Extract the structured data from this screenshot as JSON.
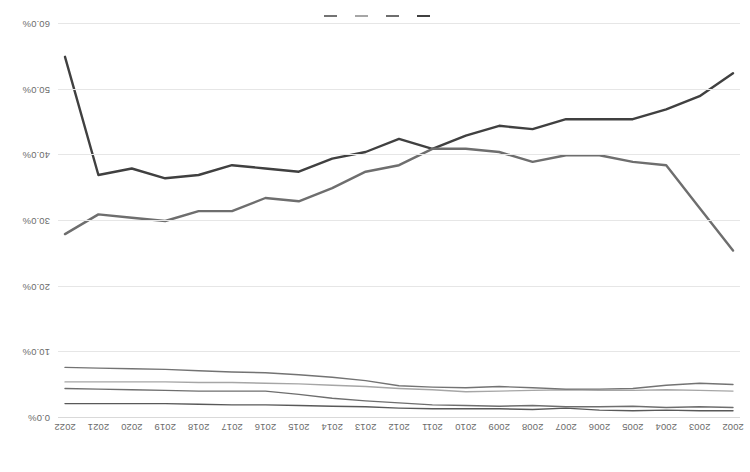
{
  "chart_data": {
    "type": "line",
    "title": "",
    "subtitle": "",
    "xlabel": "",
    "ylabel": "",
    "grid": true,
    "legend_position": "bottom",
    "orientation_note": "rotated-180",
    "xlim": [
      2002,
      2022
    ],
    "ylim": [
      0.0,
      60.0
    ],
    "ytick_labels": [
      "0.0%",
      "10.0%",
      "20.0%",
      "30.0%",
      "40.0%",
      "50.0%",
      "60.0%"
    ],
    "ytick_values": [
      0,
      10,
      20,
      30,
      40,
      50,
      60
    ],
    "categories": [
      "2002",
      "2003",
      "2004",
      "2005",
      "2006",
      "2007",
      "2008",
      "2009",
      "2010",
      "2011",
      "2012",
      "2013",
      "2014",
      "2015",
      "2016",
      "2017",
      "2018",
      "2019",
      "2020",
      "2021",
      "2022"
    ],
    "x": [
      2002,
      2003,
      2004,
      2005,
      2006,
      2007,
      2008,
      2009,
      2010,
      2011,
      2012,
      2013,
      2014,
      2015,
      2016,
      2017,
      2018,
      2019,
      2020,
      2021,
      2022
    ],
    "series": [
      {
        "name": "Series 1",
        "color": "#404040",
        "width": 2.4,
        "values": [
          52.5,
          49.0,
          47.0,
          45.5,
          45.5,
          45.5,
          44.0,
          44.5,
          43.0,
          41.0,
          42.5,
          40.5,
          39.5,
          37.5,
          38.0,
          38.5,
          37.0,
          36.5,
          38.0,
          37.0,
          55.0
        ]
      },
      {
        "name": "Series 2",
        "color": "#6e6e6e",
        "width": 2.4,
        "values": [
          25.5,
          32.0,
          38.5,
          39.0,
          40.0,
          40.0,
          39.0,
          40.5,
          41.0,
          41.0,
          38.5,
          37.5,
          35.0,
          33.0,
          33.5,
          31.5,
          31.5,
          30.0,
          30.5,
          31.0,
          28.0
        ]
      },
      {
        "name": "Series 3",
        "color": "#595959",
        "width": 1.4,
        "values": [
          1.1,
          1.1,
          1.2,
          1.1,
          1.2,
          1.5,
          1.3,
          1.4,
          1.4,
          1.4,
          1.5,
          1.7,
          1.8,
          1.9,
          2.0,
          2.0,
          2.1,
          2.2,
          2.2,
          2.2,
          2.2
        ]
      },
      {
        "name": "Series 4",
        "color": "#6e6e6e",
        "width": 1.4,
        "values": [
          1.6,
          1.7,
          1.6,
          1.8,
          1.7,
          1.7,
          1.9,
          1.8,
          1.9,
          2.0,
          2.3,
          2.6,
          3.0,
          3.6,
          4.1,
          4.1,
          4.1,
          4.2,
          4.3,
          4.4,
          4.5
        ]
      },
      {
        "name": "Series 5",
        "color": "#a6a6a6",
        "width": 1.4,
        "values": [
          4.1,
          4.2,
          4.3,
          4.2,
          4.2,
          4.3,
          4.2,
          4.1,
          4.0,
          4.3,
          4.5,
          4.8,
          5.0,
          5.2,
          5.3,
          5.4,
          5.4,
          5.5,
          5.5,
          5.5,
          5.5
        ]
      },
      {
        "name": "Series 6",
        "color": "#737373",
        "width": 1.4,
        "values": [
          5.1,
          5.3,
          5.0,
          4.5,
          4.4,
          4.4,
          4.6,
          4.8,
          4.6,
          4.7,
          4.9,
          5.7,
          6.2,
          6.6,
          6.9,
          7.0,
          7.2,
          7.4,
          7.5,
          7.6,
          7.7
        ]
      }
    ],
    "legend": [
      {
        "label": "",
        "color": "#404040"
      },
      {
        "label": "",
        "color": "#6e6e6e"
      },
      {
        "label": "",
        "color": "#a6a6a6"
      },
      {
        "label": "",
        "color": "#737373"
      }
    ]
  }
}
